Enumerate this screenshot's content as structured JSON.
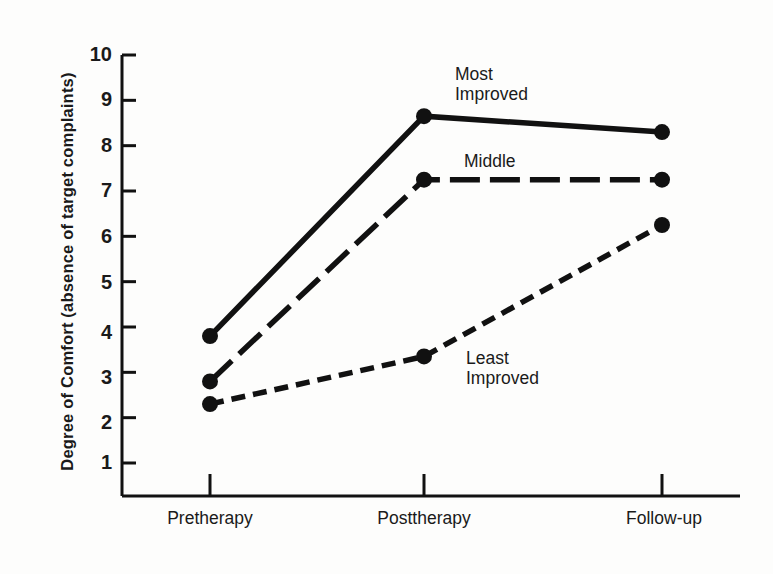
{
  "figure": {
    "background": "#fdfdfc",
    "ink_color": "#111111"
  },
  "chart_data": {
    "type": "line",
    "title": "",
    "xlabel": "",
    "ylabel": "Degree of Comfort (absence of target complaints)",
    "categories": [
      "Pretherapy",
      "Posttherapy",
      "Follow-up"
    ],
    "ylim": [
      0,
      10
    ],
    "yticks": [
      1,
      2,
      3,
      4,
      5,
      6,
      7,
      8,
      9,
      10
    ],
    "ytick_labels": [
      "1",
      "2",
      "3",
      "4",
      "5",
      "6",
      "7",
      "8",
      "9",
      "10"
    ],
    "grid": false,
    "legend": "inline-annotations",
    "series": [
      {
        "name": "Most Improved",
        "label_lines": [
          "Most",
          "Improved"
        ],
        "linestyle": "solid",
        "marker": "filled-circle",
        "values": [
          3.8,
          8.65,
          8.3
        ]
      },
      {
        "name": "Middle",
        "label_lines": [
          "Middle"
        ],
        "linestyle": "long-dashed",
        "marker": "filled-circle",
        "values": [
          2.8,
          7.25,
          7.25
        ]
      },
      {
        "name": "Least Improved",
        "label_lines": [
          "Least",
          "Improved"
        ],
        "linestyle": "short-dashed",
        "marker": "filled-circle",
        "values": [
          2.3,
          3.35,
          6.25
        ]
      }
    ]
  },
  "annotations": {
    "most_improved_line1": "Most",
    "most_improved_line2": "Improved",
    "middle": "Middle",
    "least_improved_line1": "Least",
    "least_improved_line2": "Improved"
  },
  "axes": {
    "y_axis_title": "Degree of Comfort (absence of target complaints)",
    "x_labels": [
      "Pretherapy",
      "Posttherapy",
      "Follow-up"
    ],
    "y_labels": [
      "10",
      "9",
      "8",
      "7",
      "6",
      "5",
      "4",
      "3",
      "2",
      "1"
    ]
  }
}
